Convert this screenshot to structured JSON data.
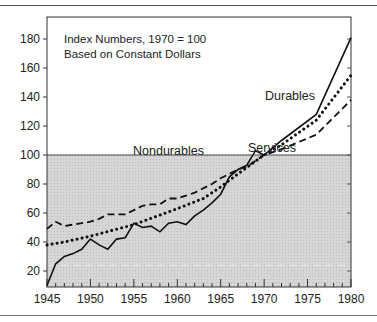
{
  "chart_data": {
    "type": "line",
    "title": "",
    "annotation": [
      "Index Numbers, 1970 = 100",
      "Based on Constant Dollars"
    ],
    "xlabel": "",
    "ylabel": "",
    "xlim": [
      1945,
      1980
    ],
    "ylim": [
      10,
      190
    ],
    "x_ticks": [
      1945,
      1950,
      1955,
      1960,
      1965,
      1970,
      1975,
      1980
    ],
    "y_ticks": [
      20,
      40,
      60,
      80,
      100,
      120,
      140,
      160,
      180
    ],
    "baseline": 100,
    "shaded_region": "below 100",
    "grid": false,
    "legend": "inline labels",
    "series": [
      {
        "name": "Durables",
        "style": "solid",
        "x": [
          1945,
          1946,
          1947,
          1948,
          1949,
          1950,
          1951,
          1952,
          1953,
          1954,
          1955,
          1956,
          1957,
          1958,
          1959,
          1960,
          1961,
          1962,
          1963,
          1964,
          1965,
          1966,
          1967,
          1968,
          1969,
          1970,
          1972,
          1976,
          1980
        ],
        "values": [
          10,
          25,
          30,
          32,
          35,
          42,
          38,
          35,
          42,
          43,
          53,
          50,
          51,
          47,
          53,
          54,
          52,
          58,
          62,
          67,
          73,
          85,
          90,
          93,
          103,
          100,
          110,
          128,
          181
        ]
      },
      {
        "name": "Nondurables",
        "style": "dashed",
        "x": [
          1945,
          1946,
          1947,
          1948,
          1949,
          1950,
          1951,
          1952,
          1953,
          1954,
          1955,
          1956,
          1957,
          1958,
          1959,
          1960,
          1961,
          1962,
          1963,
          1964,
          1965,
          1966,
          1967,
          1968,
          1969,
          1970,
          1972,
          1976,
          1980
        ],
        "values": [
          49,
          54,
          51,
          52,
          53,
          54,
          56,
          59,
          59,
          59,
          62,
          65,
          66,
          66,
          70,
          70,
          72,
          74,
          77,
          80,
          84,
          87,
          90,
          92,
          96,
          100,
          104,
          114,
          138
        ]
      },
      {
        "name": "Services",
        "style": "dotted",
        "x": [
          1945,
          1947,
          1950,
          1955,
          1960,
          1963,
          1965,
          1967,
          1970,
          1972,
          1976,
          1980
        ],
        "values": [
          38,
          40,
          44,
          52,
          63,
          70,
          78,
          87,
          100,
          107,
          124,
          155
        ]
      }
    ],
    "series_labels": {
      "durables": "Durables",
      "nondurables": "Nondurables",
      "services": "Services"
    }
  }
}
